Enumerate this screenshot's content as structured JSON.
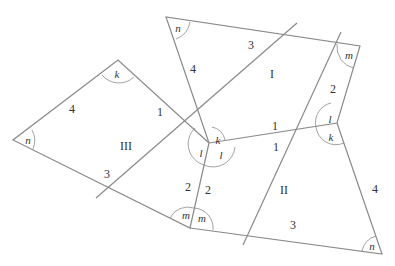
{
  "figure": {
    "colors": {
      "line": "#8a8a8a",
      "text": "#333333",
      "background": "#ffffff"
    },
    "regions": [
      {
        "id": "I",
        "label": "I"
      },
      {
        "id": "II",
        "label": "II"
      },
      {
        "id": "III",
        "label": "III"
      }
    ],
    "side_labels": {
      "top_left_4": "4",
      "top_3": "3",
      "top_1_inner": "1",
      "top_1_lower": "1",
      "top_right_2": "2",
      "left_4": "4",
      "left_1": "1",
      "left_3": "3",
      "mid_2_left": "2",
      "mid_2_right": "2",
      "mid_1": "1",
      "right_4": "4",
      "bottom_3": "3"
    },
    "angle_labels": {
      "top_n": "n",
      "top_m": "m",
      "right_l": "l",
      "right_k": "k",
      "left_k": "k",
      "left_n": "n",
      "center_k": "k",
      "center_l_left": "l",
      "center_l_right": "l",
      "bottom_m_left": "m",
      "bottom_m_right": "m",
      "bottom_n": "n"
    }
  }
}
